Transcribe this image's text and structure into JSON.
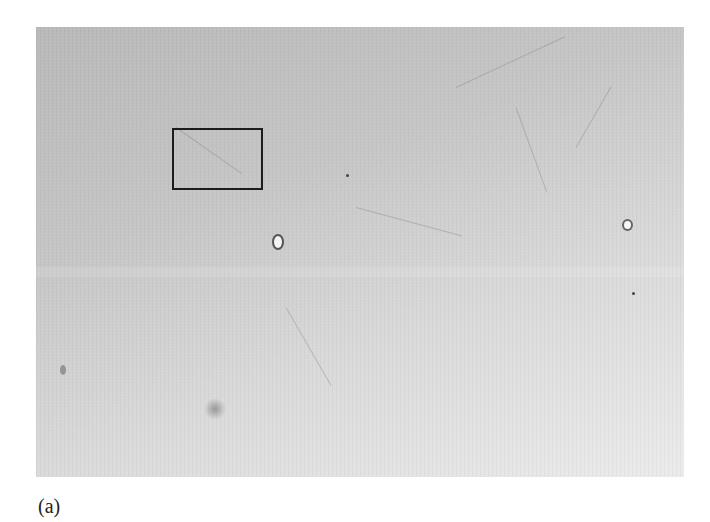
{
  "figure": {
    "panel_label": "(a)",
    "image_region": {
      "x": 36,
      "y": 27,
      "width": 648,
      "height": 450
    },
    "roi_box": {
      "x": 172,
      "y": 128,
      "width": 91,
      "height": 62,
      "color": "#1c1c1c"
    },
    "features": [
      {
        "type": "bright-round-cell",
        "x": 280,
        "y": 243
      },
      {
        "type": "bright-round-cell",
        "x": 627,
        "y": 225
      },
      {
        "type": "dark-blur-spot",
        "x": 216,
        "y": 408
      },
      {
        "type": "small-debris",
        "x": 63,
        "y": 370
      }
    ]
  }
}
